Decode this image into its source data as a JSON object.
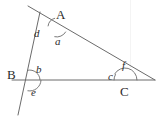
{
  "figure": {
    "kind": "geometry-diagram",
    "width": 162,
    "height": 124,
    "background_color": "#ffffff",
    "stroke_color": "#6b6b6b",
    "text_color": "#2b2b2b",
    "vertices": [
      {
        "id": "A",
        "label": "A",
        "x": 57,
        "y": 27,
        "label_x": 56,
        "label_y": 8
      },
      {
        "id": "B",
        "label": "B",
        "x": 30,
        "y": 80,
        "label_x": 7,
        "label_y": 68
      },
      {
        "id": "C",
        "label": "C",
        "x": 125,
        "y": 80,
        "label_x": 120,
        "label_y": 85
      }
    ],
    "lines": [
      {
        "id": "line-ac-extended",
        "x1": 28,
        "y1": 6,
        "x2": 155,
        "y2": 80
      },
      {
        "id": "line-ab-extended",
        "x1": 40,
        "y1": 12,
        "x2": 18,
        "y2": 115
      },
      {
        "id": "line-bc-extended",
        "x1": 12,
        "y1": 80,
        "x2": 155,
        "y2": 80
      }
    ],
    "angles": [
      {
        "id": "d",
        "label": "d",
        "vertex": "A",
        "label_x": 34,
        "label_y": 28,
        "arc_cx": 57,
        "arc_cy": 27,
        "arc_r": 9,
        "arc_start": 187,
        "arc_end": 255
      },
      {
        "id": "a",
        "label": "a",
        "vertex": "A",
        "label_x": 55,
        "label_y": 36,
        "arc_cx": 57,
        "arc_cy": 27,
        "arc_r": 10,
        "arc_start": 30,
        "arc_end": 103
      },
      {
        "id": "b",
        "label": "b",
        "vertex": "B",
        "label_x": 36,
        "label_y": 64,
        "arc_cx": 30,
        "arc_cy": 80,
        "arc_r": 10,
        "arc_start": 258,
        "arc_end": 358
      },
      {
        "id": "e",
        "label": "e",
        "vertex": "B",
        "label_x": 31,
        "label_y": 87,
        "arc_cx": 30,
        "arc_cy": 80,
        "arc_r": 11,
        "arc_start": 2,
        "arc_end": 101
      },
      {
        "id": "c",
        "label": "c",
        "vertex": "C",
        "label_x": 108,
        "label_y": 71,
        "arc_cx": 125,
        "arc_cy": 80,
        "arc_r": 11,
        "arc_start": 180,
        "arc_end": 210
      },
      {
        "id": "f",
        "label": "f",
        "vertex": "C",
        "label_x": 122,
        "label_y": 60,
        "arc_cx": 125,
        "arc_cy": 80,
        "arc_r": 12,
        "arc_start": 210,
        "arc_end": 360
      }
    ],
    "artifact": {
      "id": "scan-streak",
      "x": 130,
      "y": 0,
      "width": 1,
      "height": 68,
      "color": "#f4f4f4"
    }
  }
}
